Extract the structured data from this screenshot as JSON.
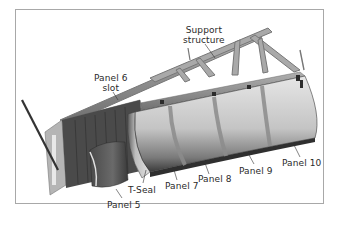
{
  "figure": {
    "labels": {
      "support_structure": [
        "Support",
        "structure"
      ],
      "panel6_slot": [
        "Panel 6",
        "slot"
      ],
      "t_seal": "T-Seal",
      "panel5": "Panel 5",
      "panel7": "Panel 7",
      "panel8": "Panel 8",
      "panel9": "Panel 9",
      "panel10": "Panel 10"
    },
    "colors": {
      "frame_border": "#a8a8a8",
      "label_text": "#2a2a2a",
      "panel_light": "#d9d9d9",
      "panel_dark": "#3c3c3c",
      "frame_steel": "#8a8a8a"
    }
  }
}
